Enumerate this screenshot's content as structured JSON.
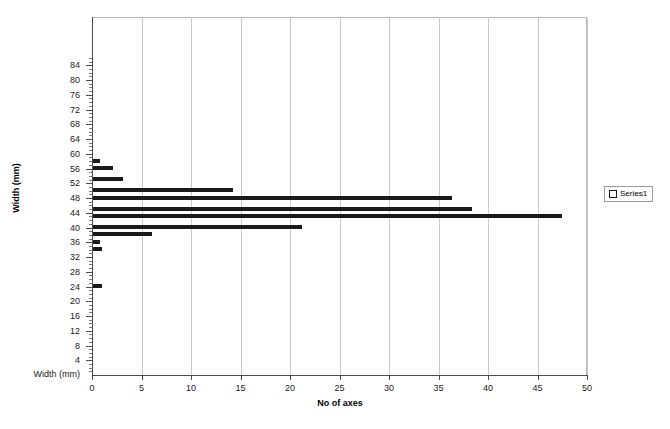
{
  "chart_data": {
    "type": "bar",
    "orientation": "horizontal",
    "title": "",
    "xlabel": "No of axes",
    "ylabel": "Width (mm)",
    "xlim": [
      0,
      50
    ],
    "ylim": [
      0,
      86
    ],
    "grid": "vertical",
    "legend_position": "right",
    "x_ticks": [
      0,
      5,
      10,
      15,
      20,
      25,
      30,
      35,
      40,
      45,
      50
    ],
    "y_ticks": [
      4,
      8,
      12,
      16,
      20,
      24,
      28,
      32,
      36,
      40,
      44,
      48,
      52,
      56,
      60,
      64,
      68,
      72,
      76,
      80,
      84
    ],
    "y_axis_base_label": "Width (mm)",
    "series": [
      {
        "name": "Series1",
        "categories": [
          63,
          61,
          58,
          55,
          53,
          50,
          48,
          45,
          43,
          41,
          39,
          29
        ],
        "values": [
          0.8,
          2.1,
          3.1,
          14.2,
          36.4,
          38.4,
          47.5,
          21.2,
          6.1,
          0.8,
          0.0,
          1.0
        ]
      }
    ],
    "bars": [
      {
        "label": "63",
        "width_mm": 63,
        "value": 0.8
      },
      {
        "label": "61",
        "width_mm": 61,
        "value": 2.1
      },
      {
        "label": "58",
        "width_mm": 58,
        "value": 3.1
      },
      {
        "label": "55",
        "width_mm": 55,
        "value": 14.2
      },
      {
        "label": "53",
        "width_mm": 53,
        "value": 36.4
      },
      {
        "label": "50",
        "width_mm": 50,
        "value": 38.4
      },
      {
        "label": "48",
        "width_mm": 48,
        "value": 47.5
      },
      {
        "label": "45",
        "width_mm": 45,
        "value": 21.2
      },
      {
        "label": "43",
        "width_mm": 43,
        "value": 6.1
      },
      {
        "label": "41",
        "width_mm": 41,
        "value": 0.8
      },
      {
        "label": "39",
        "width_mm": 39,
        "value": 1.0
      },
      {
        "label": "29",
        "width_mm": 29,
        "value": 1.0
      }
    ],
    "bar_color": "#1a1a1a",
    "gridline_color": "#c9c9c9",
    "axis_color": "#4d4d4d"
  },
  "legend": {
    "entries": [
      {
        "label": "Series1",
        "marker": "square-outline"
      }
    ]
  },
  "axes": {
    "x_title": "No of axes",
    "y_title": "Width (mm)"
  }
}
